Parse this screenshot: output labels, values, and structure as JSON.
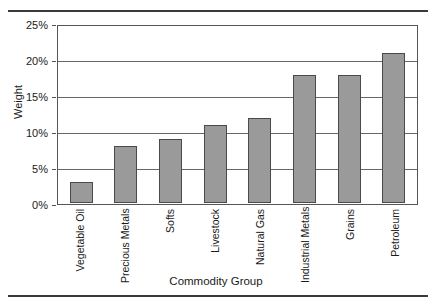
{
  "chart_data": {
    "type": "bar",
    "title": "",
    "xlabel": "Commodity Group",
    "ylabel": "Weight",
    "categories": [
      "Vegetable Oil",
      "Precious Metals",
      "Softs",
      "Livestock",
      "Natural Gas",
      "Industrial Metals",
      "Grains",
      "Petroleum"
    ],
    "values": [
      3,
      8,
      9,
      11,
      12,
      18,
      18,
      21
    ],
    "ylim": [
      0,
      25
    ],
    "y_ticks": [
      0,
      5,
      10,
      15,
      20,
      25
    ],
    "y_tick_labels": [
      "0%",
      "5%",
      "10%",
      "15%",
      "20%",
      "25%"
    ],
    "grid": true,
    "legend": "none",
    "value_unit": "%",
    "bar_color": "#9a9a9a",
    "bar_border_color": "#4a4a4a",
    "grid_color": "#666666",
    "axis_color": "#555555",
    "rule_color": "#3a3a3a"
  }
}
